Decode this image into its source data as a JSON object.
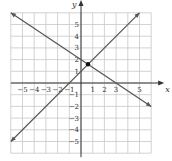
{
  "chart_data": {
    "type": "line",
    "title": "",
    "xlabel": "x",
    "ylabel": "y",
    "xlim": [
      -6,
      6
    ],
    "ylim": [
      -6,
      6
    ],
    "grid": true,
    "x_ticks": [
      "-5",
      "-4",
      "-3",
      "-2",
      "-1",
      "1",
      "2",
      "3",
      "5"
    ],
    "y_ticks": [
      "5",
      "4",
      "3",
      "2",
      "1",
      "-1",
      "-2",
      "-3",
      "-4",
      "-5"
    ],
    "series": [
      {
        "name": "y = x + 1",
        "points": [
          [
            -6,
            -5
          ],
          [
            5,
            6
          ]
        ],
        "slope": 1,
        "intercept": 1
      },
      {
        "name": "y = -2/3 x + 2",
        "points": [
          [
            -6,
            6
          ],
          [
            6,
            -2
          ]
        ],
        "slope": -0.6667,
        "intercept": 2
      }
    ],
    "annotations": [
      {
        "type": "point",
        "x": 0.6,
        "y": 1.6,
        "label": "intersection"
      }
    ]
  }
}
